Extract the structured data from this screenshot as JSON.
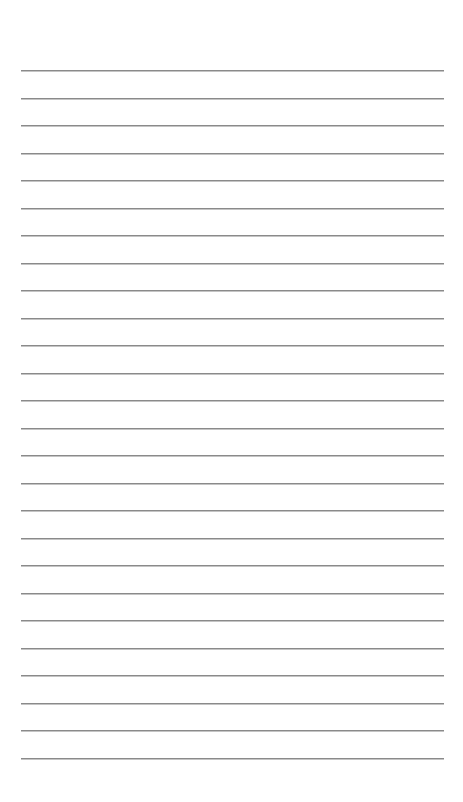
{
  "page": {
    "type": "lined-paper",
    "background_color": "#ffffff",
    "line_color": "#8a8a8a",
    "line_count": 26,
    "first_line_y": 70,
    "line_spacing": 27.5,
    "line_left": 21,
    "line_width": 423,
    "lines": []
  }
}
